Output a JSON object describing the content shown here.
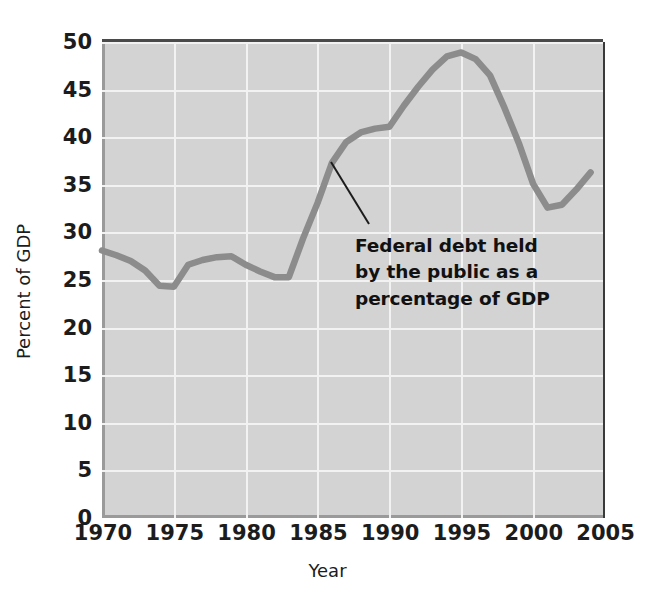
{
  "chart_data": {
    "type": "line",
    "title": "",
    "xlabel": "Year",
    "ylabel": "Percent of GDP",
    "xlim": [
      1970,
      2005
    ],
    "ylim": [
      0,
      50
    ],
    "grid": true,
    "legend": "none",
    "xticks": [
      "1970",
      "1975",
      "1980",
      "1985",
      "1990",
      "1995",
      "2000",
      "2005"
    ],
    "yticks": [
      "0",
      "5",
      "10",
      "15",
      "20",
      "25",
      "30",
      "35",
      "40",
      "45",
      "50"
    ],
    "annotations": [
      {
        "text": "Federal debt held by the public as a percentage of GDP",
        "lines": [
          "Federal debt held",
          "by the public as a",
          "percentage of GDP"
        ],
        "points_to_year": 1986,
        "points_to_value": 38.2
      }
    ],
    "series": [
      {
        "name": "Federal debt held by the public as a percentage of GDP",
        "color": "#8c8c8c",
        "x": [
          1970,
          1971,
          1972,
          1973,
          1974,
          1975,
          1976,
          1977,
          1978,
          1979,
          1980,
          1981,
          1982,
          1983,
          1984,
          1985,
          1986,
          1987,
          1988,
          1989,
          1990,
          1991,
          1992,
          1993,
          1994,
          1995,
          1996,
          1997,
          1998,
          1999,
          2000,
          2001,
          2002,
          2003,
          2004
        ],
        "values": [
          28.1,
          27.6,
          27.0,
          26.0,
          24.4,
          24.3,
          26.6,
          27.1,
          27.4,
          27.5,
          26.6,
          25.9,
          25.3,
          25.3,
          29.4,
          33.1,
          37.3,
          39.5,
          40.5,
          40.9,
          41.1,
          43.3,
          45.3,
          47.1,
          48.5,
          48.9,
          48.2,
          46.5,
          43.1,
          39.4,
          35.1,
          32.6,
          32.9,
          34.5,
          36.3
        ]
      }
    ]
  }
}
